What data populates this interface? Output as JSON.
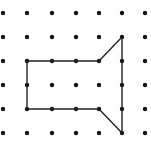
{
  "diagram": {
    "type": "dot-grid-polygon",
    "grid": {
      "columns": 7,
      "rows": 6,
      "column_x": [
        3,
        27,
        52,
        76,
        99,
        122,
        145
      ],
      "row_y": [
        13,
        37,
        61,
        85,
        109,
        133
      ],
      "dot_radius": 2.2,
      "dot_color": "#111111"
    },
    "polygon": {
      "stroke_color": "#222222",
      "stroke_width": 1.4,
      "vertices_grid": [
        [
          1,
          2
        ],
        [
          4,
          2
        ],
        [
          5,
          1
        ],
        [
          5,
          5
        ],
        [
          4,
          4
        ],
        [
          1,
          4
        ]
      ],
      "vertices_px": [
        [
          27,
          61
        ],
        [
          99,
          61
        ],
        [
          122,
          37
        ],
        [
          122,
          133
        ],
        [
          99,
          109
        ],
        [
          27,
          109
        ]
      ]
    }
  }
}
